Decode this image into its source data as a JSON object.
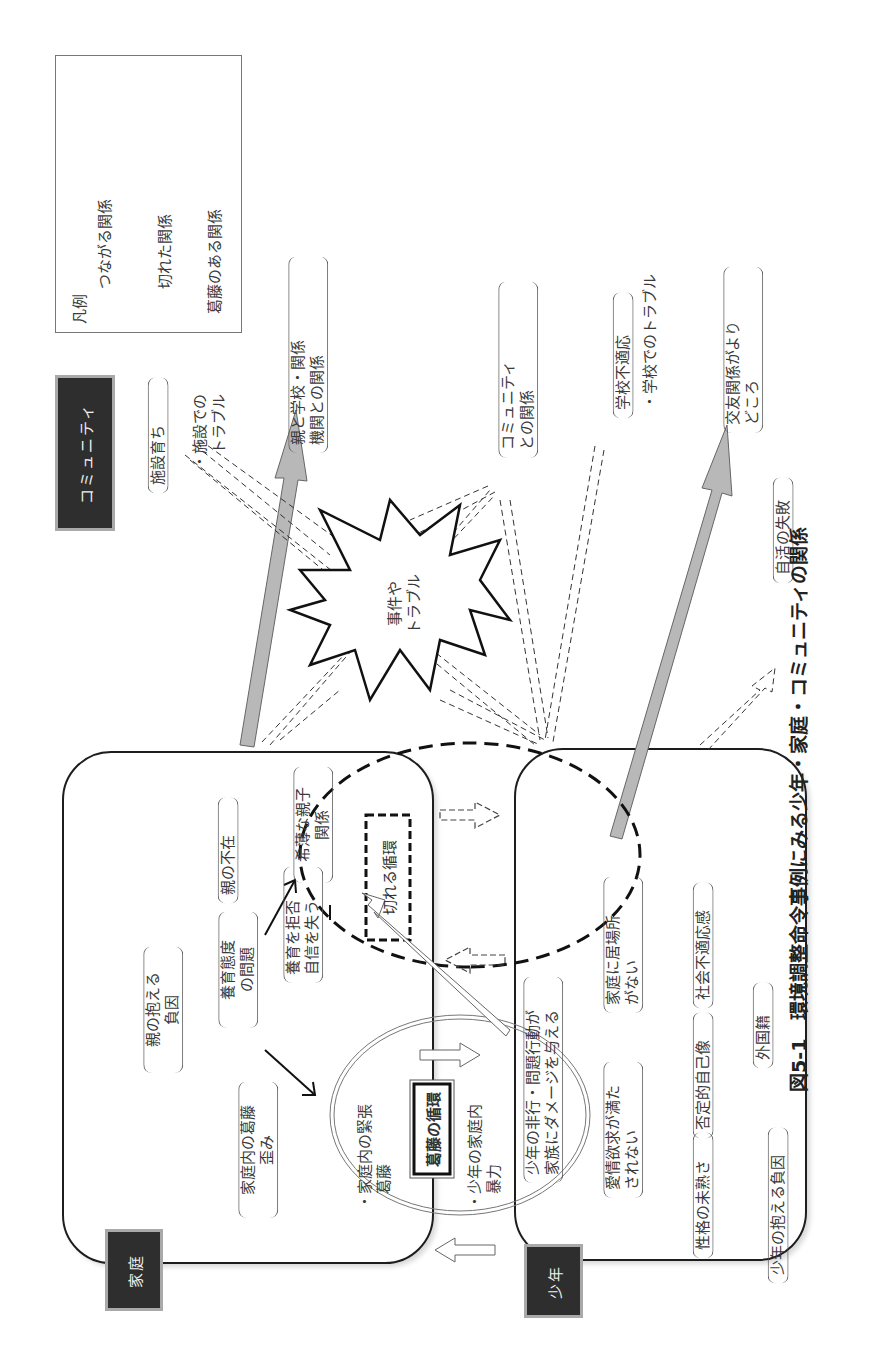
{
  "caption": "図5-1　環境調整命令事例にみる少年・家庭・コミュニティの関係",
  "legend": {
    "title": "凡例",
    "items": [
      {
        "label": "つながる関係",
        "style": "solid-gray-arrow"
      },
      {
        "label": "切れた関係",
        "style": "dashed-hollow-arrow"
      },
      {
        "label": "葛藤のある関係",
        "style": "double-line-hollow-arrow"
      }
    ]
  },
  "sections": {
    "community": "コミュニティ",
    "family": "家庭",
    "juvenile": "少年"
  },
  "community_items": {
    "facility_raised": "施設育ち",
    "facility_trouble": "・施設での\n　トラブル",
    "parent_school": "親と学校・関係\n機関との関係",
    "community_relation": "コミュニティ\nとの関係",
    "school_maladjust": "学校不適応",
    "school_trouble": "・学校でのトラブル",
    "friends_support": "交友関係がより\nどころ",
    "independence_failure": "自活の失敗"
  },
  "incident": "事件や\nトラブル",
  "family_items": {
    "parent_burden": "親の抱える\n負因",
    "parenting_attitude": "養育態度\nの問題",
    "parent_absence": "親の不在",
    "refuse_parenting": "養育を拒否\n自信を失う",
    "weak_relationship": "希薄な親子\n関係",
    "family_conflict": "家庭内の葛藤\n歪み",
    "family_tension": "・家庭内の緊張\n　葛藤",
    "juvenile_violence": "・少年の家庭内\n　暴力"
  },
  "cycles": {
    "broken_cycle": "切れる循環",
    "conflict_cycle": "葛藤の循環"
  },
  "juvenile_items": {
    "delinquency_damage": "少年の非行・問題行動が\n家族にダメージを与える",
    "love_unmet": "愛情欲求が満た\nされない",
    "no_place_home": "家庭に居場所\nがない",
    "immature_personality": "性格の未熟さ",
    "negative_self_image": "否定的自己像",
    "social_maladjust": "社会不適応感",
    "juvenile_burden": "少年の抱える負因",
    "foreign_nationality": "外国籍"
  },
  "colors": {
    "dark_label_bg": "#2e2e2e",
    "connected_arrow_fill": "#b8b8b8",
    "line": "#222222"
  }
}
